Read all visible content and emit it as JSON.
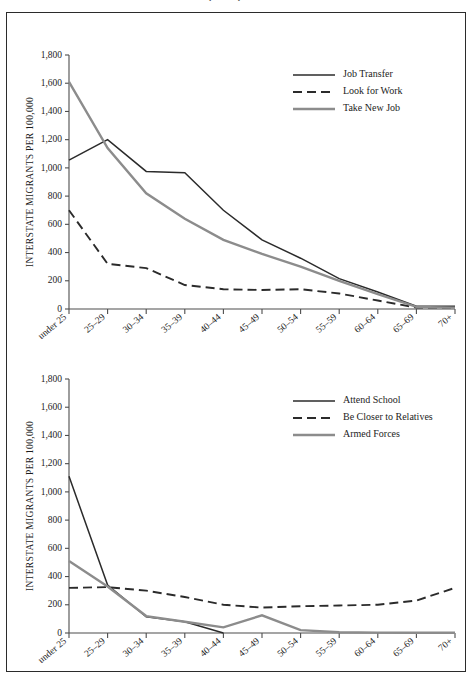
{
  "caption_top": "1975, 1980, and 1981",
  "charts": [
    {
      "id": "chart-1",
      "chart_data": {
        "type": "line",
        "title": "",
        "xlabel": "AGE",
        "ylabel": "INTERSTATE MIGRANTS PER 100,000",
        "categories": [
          "under 25",
          "25–29",
          "30–34",
          "35–39",
          "40–44",
          "45–49",
          "50–54",
          "55–59",
          "60–64",
          "65–69",
          "70+"
        ],
        "yticks": [
          0,
          200,
          400,
          600,
          800,
          1000,
          1200,
          1400,
          1600,
          1800
        ],
        "ytick_labels": [
          "0",
          "200",
          "400",
          "600",
          "800",
          "1,000",
          "1,200",
          "1,400",
          "1,600",
          "1,800"
        ],
        "ylim": [
          0,
          1800
        ],
        "grid": false,
        "legend_position": "top-right",
        "series": [
          {
            "name": "Job Transfer",
            "style": "solid",
            "color": "#2b2b2b",
            "width": 1.5,
            "values": [
              1055,
              1200,
              975,
              965,
              700,
              490,
              360,
              215,
              120,
              20,
              20
            ]
          },
          {
            "name": "Look for Work",
            "style": "dashed",
            "color": "#2b2b2b",
            "width": 1.9,
            "values": [
              700,
              320,
              290,
              170,
              140,
              135,
              140,
              110,
              60,
              10,
              10
            ]
          },
          {
            "name": "Take New Job",
            "style": "solid",
            "color": "#8c8c8c",
            "width": 2.4,
            "values": [
              1610,
              1140,
              820,
              640,
              490,
              390,
              300,
              200,
              105,
              15,
              10
            ]
          }
        ]
      }
    },
    {
      "id": "chart-2",
      "chart_data": {
        "type": "line",
        "title": "",
        "xlabel": "AGE",
        "ylabel": "INTERSTATE MIGRANTS PER 100,000",
        "categories": [
          "under 25",
          "25–29",
          "30–34",
          "35–39",
          "40–44",
          "45–49",
          "50–54",
          "55–59",
          "60–64",
          "65–69",
          "70+"
        ],
        "yticks": [
          0,
          200,
          400,
          600,
          800,
          1000,
          1200,
          1400,
          1600,
          1800
        ],
        "ytick_labels": [
          "0",
          "200",
          "400",
          "600",
          "800",
          "1,000",
          "1,200",
          "1,400",
          "1,600",
          "1,800"
        ],
        "ylim": [
          0,
          1800
        ],
        "grid": false,
        "legend_position": "top-right",
        "series": [
          {
            "name": "Attend School",
            "style": "solid",
            "color": "#2b2b2b",
            "width": 1.5,
            "values": [
              1110,
              340,
              115,
              80,
              0,
              null,
              null,
              null,
              null,
              null,
              null
            ]
          },
          {
            "name": "Be Closer to Relatives",
            "style": "dashed",
            "color": "#2b2b2b",
            "width": 1.9,
            "values": [
              320,
              325,
              300,
              255,
              200,
              180,
              190,
              195,
              200,
              230,
              320
            ]
          },
          {
            "name": "Armed Forces",
            "style": "solid",
            "color": "#8c8c8c",
            "width": 2.4,
            "values": [
              510,
              330,
              120,
              80,
              40,
              125,
              20,
              5,
              3,
              2,
              2
            ]
          }
        ]
      }
    }
  ]
}
